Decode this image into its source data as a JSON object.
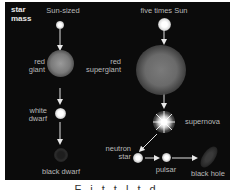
{
  "title": "star mass",
  "title_line1": "star",
  "title_line2": "mass",
  "columns": {
    "left": {
      "heading": "Sun-sized"
    },
    "right": {
      "heading": "five times Sun"
    }
  },
  "stages": {
    "red_giant": [
      "red",
      "giant"
    ],
    "white_dwarf": [
      "white",
      "dwarf"
    ],
    "black_dwarf": "black dwarf",
    "red_supergiant": [
      "red",
      "supergiant"
    ],
    "supernova": "supernova",
    "neutron_star": [
      "neutron",
      "star"
    ],
    "pulsar": "pulsar",
    "black_hole": "black hole"
  },
  "colors": {
    "background": "#0b0b0b",
    "label": "#b9b9b9"
  },
  "caption": "F   i   t   t   l   t   d"
}
